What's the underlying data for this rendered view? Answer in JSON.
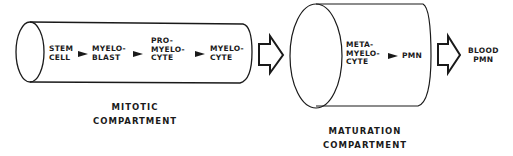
{
  "diagram": {
    "mitotic_compartment": {
      "caption_line1": "MITOTIC",
      "caption_line2": "COMPARTMENT",
      "stages": [
        {
          "line1": "STEM",
          "line2": "CELL"
        },
        {
          "line1": "MYELO-",
          "line2": "BLAST"
        },
        {
          "line1": "PRO-",
          "line2": "MYELO-",
          "line3": "CYTE"
        },
        {
          "line1": "MYELO-",
          "line2": "CYTE"
        }
      ]
    },
    "maturation_compartment": {
      "caption_line1": "MATURATION",
      "caption_line2": "COMPARTMENT",
      "stages": [
        {
          "line1": "META-",
          "line2": "MYELO-",
          "line3": "CYTE"
        },
        {
          "line1": "PMN"
        }
      ]
    },
    "output": {
      "line1": "BLOOD",
      "line2": "PMN"
    },
    "connectors": [
      "arrow-right",
      "arrow-right",
      "arrow-right",
      "arrow-right",
      "hollow-arrow-right",
      "hollow-arrow-right"
    ],
    "colors": {
      "ink": "#1a1a1a",
      "background": "#ffffff"
    }
  }
}
